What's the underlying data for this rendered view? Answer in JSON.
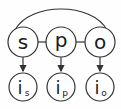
{
  "diagram": {
    "nodes_top": [
      {
        "id": "s",
        "label": "s",
        "cx": 23,
        "cy": 42
      },
      {
        "id": "p",
        "label": "p",
        "cx": 61,
        "cy": 42
      },
      {
        "id": "o",
        "label": "o",
        "cx": 100,
        "cy": 42
      }
    ],
    "nodes_bottom": [
      {
        "id": "i_s",
        "label": "i",
        "sub": "s",
        "cx": 23,
        "cy": 87
      },
      {
        "id": "i_p",
        "label": "i",
        "sub": "p",
        "cx": 61,
        "cy": 87
      },
      {
        "id": "i_o",
        "label": "i",
        "sub": "o",
        "cx": 100,
        "cy": 87
      }
    ],
    "edges": [
      {
        "from": "s",
        "to": "p",
        "type": "undirected"
      },
      {
        "from": "p",
        "to": "o",
        "type": "undirected"
      },
      {
        "from": "s",
        "to": "o",
        "type": "arc"
      },
      {
        "from": "s",
        "to": "i_s",
        "type": "directed"
      },
      {
        "from": "p",
        "to": "i_p",
        "type": "directed"
      },
      {
        "from": "o",
        "to": "i_o",
        "type": "directed"
      }
    ],
    "colors": {
      "stroke": "#333333",
      "fill": "#ffffff",
      "text": "#1a1a1a"
    }
  }
}
